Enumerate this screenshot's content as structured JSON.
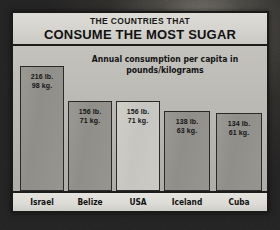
{
  "panel": {
    "title_line1": "THE COUNTRIES THAT",
    "title_line2": "CONSUME THE MOST SUGAR",
    "subtitle": "Annual consumption per capita in pounds/kilograms"
  },
  "colors": {
    "panel_background": "#b9b9b5",
    "header_background": "#d8d6d0",
    "bar_fill": "#939289",
    "bar_fill_highlight": "#c9c8c3",
    "bar_border": "#2a2a28",
    "label_band": "#e0ded8",
    "text": "#141414",
    "backdrop": "#2b2b2b"
  },
  "chart_data": {
    "type": "bar",
    "title": "THE COUNTRIES THAT CONSUME THE MOST SUGAR",
    "subtitle": "Annual consumption per capita in pounds/kilograms",
    "xlabel": "",
    "ylabel": "",
    "unit_primary": "lb.",
    "unit_secondary": "kg.",
    "ylim": [
      0,
      216
    ],
    "grid": false,
    "legend": false,
    "categories": [
      "Israel",
      "Belize",
      "USA",
      "Iceland",
      "Cuba"
    ],
    "values": [
      216,
      156,
      156,
      138,
      134
    ],
    "series": [
      {
        "name": "pounds",
        "values": [
          216,
          156,
          156,
          138,
          134
        ]
      },
      {
        "name": "kilograms",
        "values": [
          98,
          71,
          71,
          63,
          61
        ]
      }
    ],
    "bars": [
      {
        "country": "Israel",
        "pounds": 216,
        "kilograms": 98,
        "label_lb": "216 lb.",
        "label_kg": "98 kg.",
        "highlight": false
      },
      {
        "country": "Belize",
        "pounds": 156,
        "kilograms": 71,
        "label_lb": "156 lb.",
        "label_kg": "71 kg.",
        "highlight": false
      },
      {
        "country": "USA",
        "pounds": 156,
        "kilograms": 71,
        "label_lb": "156 lb.",
        "label_kg": "71 kg.",
        "highlight": true
      },
      {
        "country": "Iceland",
        "pounds": 138,
        "kilograms": 63,
        "label_lb": "138 lb.",
        "label_kg": "63 kg.",
        "highlight": false
      },
      {
        "country": "Cuba",
        "pounds": 134,
        "kilograms": 61,
        "label_lb": "134 lb.",
        "label_kg": "61 kg.",
        "highlight": false
      }
    ]
  }
}
